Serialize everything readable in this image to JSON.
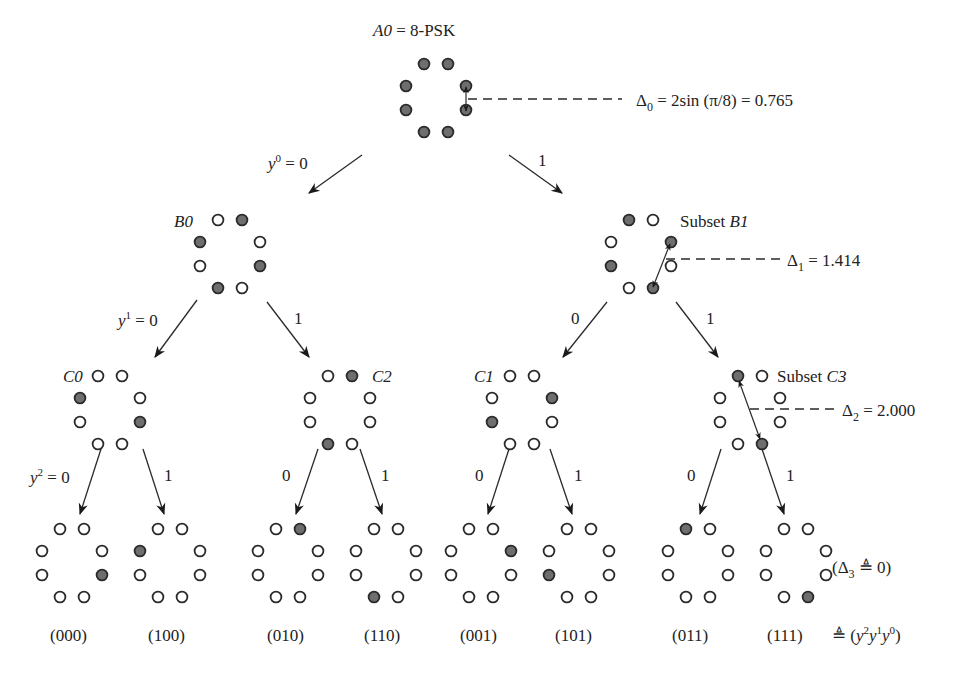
{
  "root": {
    "label_var": "A0",
    "label_rest": " = 8-PSK"
  },
  "delta_labels": {
    "d0": "Δ0 = 2sin(π/8) = 0.765",
    "d0_sym": "Δ",
    "d0_sub": "0",
    "d0_rest": " = 2sin (π/8) = 0.765",
    "d1_sym": "Δ",
    "d1_sub": "1",
    "d1_rest": " = 1.414",
    "d2_sym": "Δ",
    "d2_sub": "2",
    "d2_rest": " = 2.000",
    "d3_open": "(Δ",
    "d3_sub": "3",
    "d3_rest": " ≜ 0)"
  },
  "subset_labels": {
    "B0": "B0",
    "B1_prefix": "Subset ",
    "B1": "B1",
    "C0": "C0",
    "C1": "C1",
    "C2": "C2",
    "C3_prefix": "Subset ",
    "C3": "C3"
  },
  "branch_labels": {
    "y0_var": "y",
    "y0_sup": "0",
    "y0_val": " = 0",
    "a_right": "1",
    "y1_var": "y",
    "y1_sup": "1",
    "y1_val": " = 0",
    "b0_right": "1",
    "b1_left": "0",
    "b1_right": "1",
    "y2_var": "y",
    "y2_sup": "2",
    "y2_val": " = 0",
    "c0_right": "1",
    "c2_left": "0",
    "c2_right": "1",
    "c1_left": "0",
    "c1_right": "1",
    "c3_left": "0",
    "c3_right": "1"
  },
  "leaf_labels": [
    "(000)",
    "(100)",
    "(010)",
    "(110)",
    "(001)",
    "(101)",
    "(011)",
    "(111)"
  ],
  "leaf_def": {
    "prefix": "≜ (",
    "v2": "y",
    "s2": "2",
    "v1": "y",
    "s1": "1",
    "v0": "y",
    "s0": "0",
    "suffix": ")"
  },
  "point_order": [
    "TL",
    "TR",
    "RU",
    "RL",
    "BR",
    "BL",
    "LL",
    "LU"
  ],
  "constellations": [
    {
      "id": "A0",
      "cx": 436,
      "cy": 98,
      "filled": [
        "TL",
        "TR",
        "RU",
        "RL",
        "BR",
        "BL",
        "LL",
        "LU"
      ]
    },
    {
      "id": "B0",
      "cx": 230,
      "cy": 254,
      "filled": [
        "TR",
        "LU",
        "RL",
        "BL"
      ]
    },
    {
      "id": "B1",
      "cx": 641,
      "cy": 254,
      "filled": [
        "TL",
        "RU",
        "LL",
        "BR"
      ]
    },
    {
      "id": "C0",
      "cx": 110,
      "cy": 410,
      "filled": [
        "LU",
        "RL"
      ]
    },
    {
      "id": "C2",
      "cx": 340,
      "cy": 410,
      "filled": [
        "TR",
        "BL"
      ]
    },
    {
      "id": "C1",
      "cx": 522,
      "cy": 410,
      "filled": [
        "RU",
        "LL"
      ]
    },
    {
      "id": "C3",
      "cx": 750,
      "cy": 410,
      "filled": [
        "TL",
        "BR"
      ]
    },
    {
      "id": "L000",
      "cx": 72,
      "cy": 563,
      "filled": [
        "RL"
      ]
    },
    {
      "id": "L100",
      "cx": 170,
      "cy": 563,
      "filled": [
        "LU"
      ]
    },
    {
      "id": "L010",
      "cx": 288,
      "cy": 563,
      "filled": [
        "TR"
      ]
    },
    {
      "id": "L110",
      "cx": 386,
      "cy": 563,
      "filled": [
        "BL"
      ]
    },
    {
      "id": "L001",
      "cx": 481,
      "cy": 563,
      "filled": [
        "RU"
      ]
    },
    {
      "id": "L101",
      "cx": 579,
      "cy": 563,
      "filled": [
        "LL"
      ]
    },
    {
      "id": "L011",
      "cx": 698,
      "cy": 563,
      "filled": [
        "TL"
      ]
    },
    {
      "id": "L111",
      "cx": 796,
      "cy": 563,
      "filled": [
        "BR"
      ]
    }
  ]
}
